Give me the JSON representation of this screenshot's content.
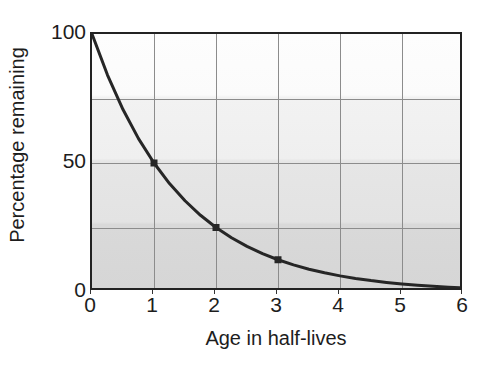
{
  "chart_data": {
    "type": "line",
    "title": "",
    "subtitle": "",
    "xlabel": "Age in half-lives",
    "ylabel": "Percentage remaining",
    "xlim": [
      0,
      6
    ],
    "ylim": [
      0,
      100
    ],
    "grid": true,
    "legend": null,
    "legend_position": "none",
    "x_ticks": [
      0,
      1,
      2,
      3,
      4,
      5,
      6
    ],
    "x_tick_labels": [
      "0",
      "1",
      "2",
      "3",
      "4",
      "5",
      "6"
    ],
    "y_ticks": [
      0,
      50,
      100
    ],
    "y_tick_labels": [
      "0",
      "50",
      "100"
    ],
    "y_gridlines": [
      25,
      50,
      75
    ],
    "x_gridlines": [
      1,
      2,
      3,
      4,
      5
    ],
    "series": [
      {
        "name": "Percentage remaining",
        "formula": "y = 100 * (0.5)^x",
        "color": "#262626",
        "line_width": 3,
        "x": [
          0,
          0.25,
          0.5,
          0.75,
          1,
          1.25,
          1.5,
          1.75,
          2,
          2.25,
          2.5,
          2.75,
          3,
          3.25,
          3.5,
          3.75,
          4,
          4.25,
          4.5,
          4.75,
          5,
          5.25,
          5.5,
          5.75,
          6
        ],
        "values": [
          100,
          84.09,
          70.71,
          59.46,
          50,
          42.04,
          35.36,
          29.73,
          25,
          21.02,
          17.68,
          14.87,
          12.5,
          10.51,
          8.84,
          7.43,
          6.25,
          5.26,
          4.42,
          3.72,
          3.125,
          2.63,
          2.21,
          1.86,
          1.5625
        ]
      }
    ],
    "markers": [
      {
        "x": 1,
        "y": 50,
        "label": "50"
      },
      {
        "x": 2,
        "y": 25,
        "label": "25"
      },
      {
        "x": 3,
        "y": 12.5,
        "label": "12.5"
      }
    ],
    "marker_color": "#262626",
    "marker_size": 7,
    "plot_background": "#e6e6e6",
    "gridline_color": "#8c8c8c",
    "border_color": "#222222"
  }
}
